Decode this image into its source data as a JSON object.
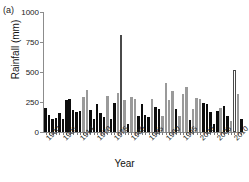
{
  "panel": {
    "label": "(a)"
  },
  "axes": {
    "ylabel": "Rainfall (mm)",
    "xlabel": "Year",
    "yticks": [
      0,
      250,
      500,
      750,
      1000
    ],
    "ylim": [
      0,
      1000
    ],
    "xtick_labels": [
      "1900",
      "1905",
      "1914",
      "1970",
      "1975",
      "1980",
      "1985",
      "1990",
      "1995",
      "2000",
      "2005",
      "2010"
    ],
    "xtick_label_indices": [
      0,
      5,
      10,
      15,
      20,
      25,
      30,
      35,
      40,
      45,
      50,
      55
    ]
  },
  "colors": {
    "black": "#0d0d0d",
    "gray": "#9a9a9a",
    "white": "#ffffff",
    "axis": "#8c8c8c"
  },
  "chart_data": {
    "type": "bar",
    "title": "",
    "xlabel": "Year",
    "ylabel": "Rainfall (mm)",
    "ylim": [
      0,
      1000
    ],
    "grid": false,
    "legend": "none",
    "categories": [
      "1900",
      "1901",
      "1902",
      "1903",
      "1904",
      "1905",
      "1906",
      "1907",
      "1908",
      "1909",
      "1914",
      "1915",
      "1916",
      "1917",
      "1918",
      "1970",
      "1971",
      "1972",
      "1973",
      "1974",
      "1975",
      "1976",
      "1977",
      "1978",
      "1979",
      "1980",
      "1981",
      "1982",
      "1983",
      "1984",
      "1985",
      "1986",
      "1987",
      "1988",
      "1989",
      "1990",
      "1991",
      "1992",
      "1993",
      "1994",
      "1995",
      "1996",
      "1997",
      "1998",
      "1999",
      "2000",
      "2001",
      "2002",
      "2003",
      "2004",
      "2005",
      "2006",
      "2007",
      "2008",
      "2009",
      "2010",
      "2011",
      "2012"
    ],
    "values": [
      200,
      145,
      110,
      120,
      160,
      110,
      265,
      275,
      180,
      170,
      175,
      295,
      350,
      185,
      110,
      230,
      155,
      125,
      300,
      110,
      240,
      325,
      810,
      265,
      65,
      290,
      275,
      135,
      230,
      145,
      125,
      275,
      205,
      195,
      135,
      405,
      270,
      340,
      195,
      135,
      320,
      375,
      100,
      195,
      280,
      275,
      240,
      235,
      170,
      70,
      175,
      200,
      215,
      130,
      95,
      520,
      320,
      105
    ],
    "series_fill": [
      "black",
      "black",
      "black",
      "black",
      "black",
      "black",
      "black",
      "black",
      "black",
      "black",
      "black",
      "gray",
      "gray",
      "black",
      "black",
      "black",
      "black",
      "black",
      "gray",
      "black",
      "black",
      "gray",
      "white",
      "gray",
      "black",
      "gray",
      "gray",
      "black",
      "black",
      "black",
      "black",
      "gray",
      "black",
      "black",
      "gray",
      "gray",
      "gray",
      "gray",
      "black",
      "gray",
      "gray",
      "gray",
      "black",
      "gray",
      "gray",
      "gray",
      "black",
      "black",
      "black",
      "black",
      "black",
      "gray",
      "black",
      "black",
      "gray",
      "white",
      "gray",
      "black"
    ]
  }
}
